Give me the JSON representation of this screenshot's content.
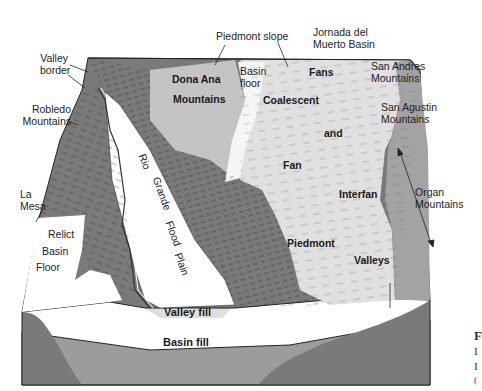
{
  "diagram": {
    "type": "block-diagram",
    "colors": {
      "background": "#ffffff",
      "mountains_dark": "#6e6e6e",
      "mountains_mid": "#8a8a8a",
      "piedmont_light": "#d4d4d4",
      "fan_light": "#e2e2e2",
      "flood_plain": "#ffffff",
      "basin_fill": "#9c9c9c",
      "basin_fill_dark": "#7a7a7a",
      "valley_fill": "#dedede",
      "outline": "#222222"
    },
    "labels": {
      "valley_border": "Valley\nborder",
      "robledo": "Robledo\nMountains",
      "la_mesa": "La\nMesa",
      "piedmont_slope": "Piedmont slope",
      "jornada": "Jornada del\nMuerto Basin",
      "basin_floor": "Basin\nfloor",
      "dona_ana_1": "Dona Ana",
      "dona_ana_2": "Mountains",
      "fans": "Fans",
      "coalescent": "Coalescent",
      "and": "and",
      "fan": "Fan",
      "interfan": "Interfan",
      "piedmont": "Piedmont",
      "valleys": "Valleys",
      "san_andres": "San Andres\nMountains",
      "san_agustin": "San Agustin\nMountains",
      "organ": "Organ\nMountains",
      "relict": "Relict",
      "basin": "Basin",
      "floor": "Floor",
      "rio": "Rio",
      "grande": "Grande",
      "flood": "Flood",
      "plain": "Plain",
      "valley_fill": "Valley fill",
      "basin_fill": "Basin fill"
    },
    "edge_fragments": [
      "F",
      "I",
      "I",
      "("
    ]
  }
}
